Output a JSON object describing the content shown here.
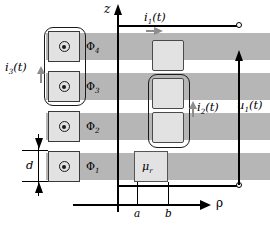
{
  "figure": {
    "kind": "electromagnetics-coil-cross-section-diagram",
    "axes": {
      "vertical": {
        "label": "z",
        "name": "z-axis"
      },
      "horizontal": {
        "label": "ρ",
        "name": "rho-axis"
      },
      "ticks": [
        {
          "label": "a",
          "x": 137
        },
        {
          "label": "b",
          "x": 168
        }
      ]
    },
    "flux_bands": [
      {
        "label": "Φ",
        "sub": "4",
        "text": "Φ4"
      },
      {
        "label": "Φ",
        "sub": "3",
        "text": "Φ3"
      },
      {
        "label": "Φ",
        "sub": "2",
        "text": "Φ2"
      },
      {
        "label": "Φ",
        "sub": "1",
        "text": "Φ1"
      }
    ],
    "currents": [
      {
        "name": "i1",
        "text": "i₁(t)",
        "base": "i",
        "sub": "1",
        "arg": "(t)",
        "direction": "right"
      },
      {
        "name": "i2",
        "text": "i₂(t)",
        "base": "i",
        "sub": "2",
        "arg": "(t)",
        "direction": "up"
      },
      {
        "name": "i3",
        "text": "i₃(t)",
        "base": "i",
        "sub": "3",
        "arg": "(t)",
        "direction": "up"
      }
    ],
    "voltage": {
      "name": "u1",
      "text": "u₁(t)",
      "base": "u",
      "sub": "1",
      "arg": "(t)",
      "direction": "up"
    },
    "material": {
      "text": "μ",
      "sub": "r",
      "full": "μr"
    },
    "dimension": {
      "label": "d",
      "meaning": "band-thickness"
    },
    "colors": {
      "band_outer": "#b6b6b6",
      "band_inner": "#c9c9c9",
      "coil_fill": "#e2e2e2",
      "stroke": "#1a1a1a",
      "arrow_gray": "#8d8d8d",
      "background": "#ffffff"
    }
  }
}
